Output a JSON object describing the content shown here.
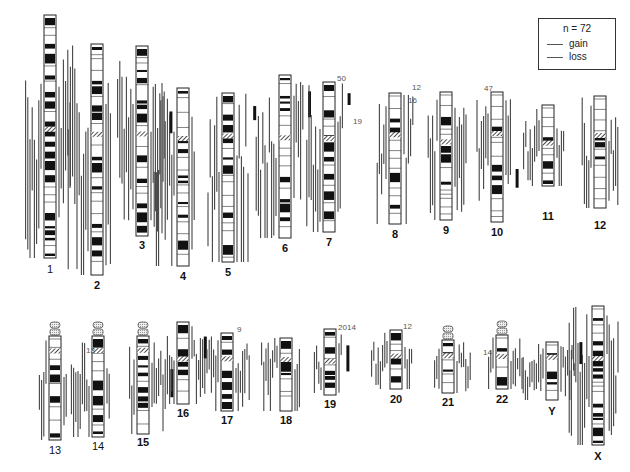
{
  "figure": {
    "type": "CGH karyogram (summary of copy number gains and losses)",
    "legend": {
      "n_label": "n = 72",
      "gain_label": "gain",
      "loss_label": "loss"
    }
  },
  "chromosomes": [
    {
      "id": "1",
      "x": 50,
      "top": 15,
      "bot": 258,
      "cen": 0.46,
      "label_y": 263,
      "bold": false
    },
    {
      "id": "2",
      "x": 97,
      "top": 44,
      "bot": 275,
      "cen": 0.38,
      "label_y": 279,
      "bold": true
    },
    {
      "id": "3",
      "x": 142,
      "top": 46,
      "bot": 236,
      "cen": 0.45,
      "label_y": 239,
      "bold": true
    },
    {
      "id": "4",
      "x": 183,
      "top": 88,
      "bot": 266,
      "cen": 0.27,
      "label_y": 270,
      "bold": true
    },
    {
      "id": "5",
      "x": 228,
      "top": 93,
      "bot": 262,
      "cen": 0.24,
      "label_y": 266,
      "bold": true
    },
    {
      "id": "6",
      "x": 285,
      "top": 75,
      "bot": 238,
      "cen": 0.37,
      "label_y": 242,
      "bold": true
    },
    {
      "id": "7",
      "x": 329,
      "top": 82,
      "bot": 232,
      "cen": 0.36,
      "label_y": 236,
      "bold": true
    },
    {
      "id": "8",
      "x": 395,
      "top": 93,
      "bot": 224,
      "cen": 0.3,
      "label_y": 228,
      "bold": true
    },
    {
      "id": "9",
      "x": 446,
      "top": 92,
      "bot": 220,
      "cen": 0.37,
      "label_y": 224,
      "bold": true
    },
    {
      "id": "10",
      "x": 497,
      "top": 92,
      "bot": 222,
      "cen": 0.3,
      "label_y": 226,
      "bold": true
    },
    {
      "id": "11",
      "x": 548,
      "top": 105,
      "bot": 186,
      "cen": 0.44,
      "label_y": 210,
      "bold": true
    },
    {
      "id": "12",
      "x": 600,
      "top": 96,
      "bot": 208,
      "cen": 0.33,
      "label_y": 219,
      "bold": true
    },
    {
      "id": "13",
      "x": 55,
      "top": 336,
      "bot": 440,
      "cen": 0.12,
      "label_y": 444,
      "bold": false,
      "acro": true
    },
    {
      "id": "14",
      "x": 98,
      "top": 336,
      "bot": 437,
      "cen": 0.12,
      "label_y": 440,
      "bold": false,
      "acro": true
    },
    {
      "id": "15",
      "x": 143,
      "top": 336,
      "bot": 434,
      "cen": 0.12,
      "label_y": 436,
      "bold": true,
      "acro": true
    },
    {
      "id": "16",
      "x": 183,
      "top": 322,
      "bot": 404,
      "cen": 0.42,
      "label_y": 407,
      "bold": true
    },
    {
      "id": "17",
      "x": 227,
      "top": 333,
      "bot": 411,
      "cen": 0.3,
      "label_y": 414,
      "bold": true
    },
    {
      "id": "18",
      "x": 286,
      "top": 338,
      "bot": 411,
      "cen": 0.26,
      "label_y": 414,
      "bold": true
    },
    {
      "id": "19",
      "x": 330,
      "top": 329,
      "bot": 395,
      "cen": 0.45,
      "label_y": 398,
      "bold": true
    },
    {
      "id": "20",
      "x": 396,
      "top": 330,
      "bot": 389,
      "cen": 0.4,
      "label_y": 393,
      "bold": true
    },
    {
      "id": "21",
      "x": 448,
      "top": 340,
      "bot": 393,
      "cen": 0.25,
      "label_y": 396,
      "bold": true,
      "acro": true
    },
    {
      "id": "22",
      "x": 502,
      "top": 335,
      "bot": 389,
      "cen": 0.35,
      "label_y": 393,
      "bold": true,
      "acro": true
    },
    {
      "id": "Y",
      "x": 552,
      "top": 342,
      "bot": 400,
      "cen": 0.22,
      "label_y": 405,
      "bold": true
    },
    {
      "id": "X",
      "x": 598,
      "top": 306,
      "bot": 445,
      "cen": 0.36,
      "label_y": 450,
      "bold": true
    }
  ],
  "count_annotations": [
    {
      "text": "50",
      "x": 337,
      "y": 74
    },
    {
      "text": "19",
      "x": 353,
      "y": 117
    },
    {
      "text": "12",
      "x": 412,
      "y": 83
    },
    {
      "text": "16",
      "x": 408,
      "y": 96
    },
    {
      "text": "47",
      "x": 484,
      "y": 84
    },
    {
      "text": "13",
      "x": 86,
      "y": 346
    },
    {
      "text": "9",
      "x": 237,
      "y": 325
    },
    {
      "text": "20",
      "x": 338,
      "y": 323
    },
    {
      "text": "14",
      "x": 347,
      "y": 323
    },
    {
      "text": "12",
      "x": 403,
      "y": 322
    },
    {
      "text": "14",
      "x": 483,
      "y": 348
    }
  ],
  "chart_data": {
    "type": "ideogram",
    "title": "",
    "n": 72,
    "legend": [
      "gain",
      "loss"
    ],
    "categories": [
      "1",
      "2",
      "3",
      "4",
      "5",
      "6",
      "7",
      "8",
      "9",
      "10",
      "11",
      "12",
      "13",
      "14",
      "15",
      "16",
      "17",
      "18",
      "19",
      "20",
      "21",
      "22",
      "Y",
      "X"
    ],
    "annotated_counts": {
      "7": [
        50,
        19
      ],
      "8": [
        16
      ],
      "9": [
        12
      ],
      "10": [
        47
      ],
      "14": [
        13
      ],
      "17": [
        9
      ],
      "19": [
        20,
        14
      ],
      "20": [
        12
      ],
      "22": [
        14
      ]
    }
  }
}
